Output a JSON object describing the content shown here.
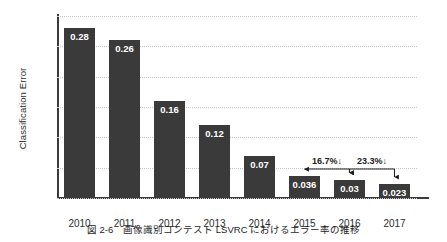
{
  "chart_data": {
    "type": "bar",
    "title": "",
    "xlabel": "",
    "ylabel": "Classification Error",
    "categories": [
      "2010",
      "2011",
      "2012",
      "2013",
      "2014",
      "2015",
      "2016",
      "2017"
    ],
    "values": [
      0.28,
      0.26,
      0.16,
      0.12,
      0.07,
      0.036,
      0.03,
      0.023
    ],
    "value_labels": [
      "0.28",
      "0.26",
      "0.16",
      "0.12",
      "0.07",
      "0.036",
      "0.03",
      "0.023"
    ],
    "ylim": [
      0,
      0.3
    ],
    "ytick_values": [
      0.0,
      0.05,
      0.1,
      0.15,
      0.2,
      0.25,
      0.3
    ],
    "ytick_labels": [
      "0.00",
      "0.05",
      "0.10",
      "0.15",
      "0.20",
      "0.25",
      "0.30"
    ],
    "grid": true,
    "legend": "none",
    "bar_color": "#3a3a3a",
    "grid_color": "#c8c8c8",
    "axis_color": "#3b3b3b",
    "annotations": [
      {
        "label": "16.7%↓",
        "from": "2015",
        "to": "2016"
      },
      {
        "label": "23.3%↓",
        "from": "2016",
        "to": "2017"
      }
    ]
  },
  "caption": {
    "text": "図 2-6　画像識別コンテスト LSVRC におけるエラー率の推移"
  }
}
